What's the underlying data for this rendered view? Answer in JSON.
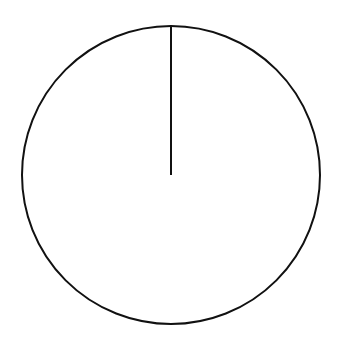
{
  "chart_data": {
    "type": "pie",
    "title": "",
    "categories": [
      "Slice 1"
    ],
    "values": [
      100
    ],
    "labels_visible": false,
    "legend": "none",
    "start_angle_deg": 90,
    "style": {
      "fill": "#ffffff",
      "stroke": "#111111",
      "stroke_width": 2
    },
    "geometry": {
      "cx": 171,
      "cy": 175,
      "r": 149
    }
  }
}
